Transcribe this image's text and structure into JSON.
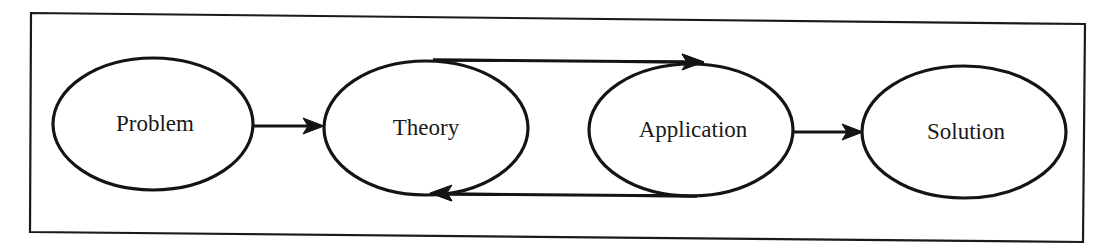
{
  "diagram": {
    "type": "flow",
    "frame": {
      "points": [
        [
          31,
          13
        ],
        [
          1085,
          24
        ],
        [
          1083,
          242
        ],
        [
          30,
          232
        ]
      ]
    },
    "nodes": [
      {
        "id": "problem",
        "label": "Problem",
        "shape": "ellipse",
        "cx": 153,
        "cy": 124,
        "rx": 100,
        "ry": 66
      },
      {
        "id": "theory",
        "label": "Theory",
        "shape": "ellipse",
        "cx": 426,
        "cy": 128,
        "rx": 102,
        "ry": 67
      },
      {
        "id": "application",
        "label": "Application",
        "shape": "ellipse",
        "cx": 691,
        "cy": 130,
        "rx": 102,
        "ry": 66
      },
      {
        "id": "solution",
        "label": "Solution",
        "shape": "ellipse",
        "cx": 964,
        "cy": 132,
        "rx": 102,
        "ry": 66
      }
    ],
    "edges": [
      {
        "from": "problem",
        "to": "theory",
        "path": "straight"
      },
      {
        "from": "theory",
        "to": "application",
        "path": "top-loop"
      },
      {
        "from": "application",
        "to": "theory",
        "path": "bottom-loop"
      },
      {
        "from": "application",
        "to": "solution",
        "path": "straight"
      }
    ]
  }
}
